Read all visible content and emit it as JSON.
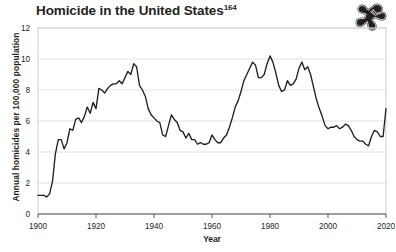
{
  "figure": {
    "title": "Homicide in the United States",
    "title_superscript": "164",
    "icon": "body-outline-icon",
    "background_color": "#ffffff",
    "line_color": "#231f20",
    "grid_color": "#d9d9d9"
  },
  "chart_data": {
    "type": "line",
    "title": "Homicide in the United States",
    "xlabel": "Year",
    "ylabel": "Annual homicides per 100,000 population",
    "xlim": [
      1900,
      2020
    ],
    "ylim": [
      0,
      12
    ],
    "xticks": [
      "1900",
      "1920",
      "1940",
      "1960",
      "1980",
      "2000",
      "2020"
    ],
    "xtick_values": [
      1900,
      1920,
      1940,
      1960,
      1980,
      2000,
      2020
    ],
    "yticks": [
      "0",
      "2",
      "4",
      "6",
      "8",
      "10",
      "12"
    ],
    "ytick_values": [
      0,
      2,
      4,
      6,
      8,
      10,
      12
    ],
    "grid": true,
    "legend": false,
    "series": [
      {
        "name": "Annual homicides per 100,000 population",
        "color": "#231f20",
        "x": [
          1900,
          1901,
          1902,
          1903,
          1904,
          1905,
          1906,
          1907,
          1908,
          1909,
          1910,
          1911,
          1912,
          1913,
          1914,
          1915,
          1916,
          1917,
          1918,
          1919,
          1920,
          1921,
          1922,
          1923,
          1924,
          1925,
          1926,
          1927,
          1928,
          1929,
          1930,
          1931,
          1932,
          1933,
          1934,
          1935,
          1936,
          1937,
          1938,
          1939,
          1940,
          1941,
          1942,
          1943,
          1944,
          1945,
          1946,
          1947,
          1948,
          1949,
          1950,
          1951,
          1952,
          1953,
          1954,
          1955,
          1956,
          1957,
          1958,
          1959,
          1960,
          1961,
          1962,
          1963,
          1964,
          1965,
          1966,
          1967,
          1968,
          1969,
          1970,
          1971,
          1972,
          1973,
          1974,
          1975,
          1976,
          1977,
          1978,
          1979,
          1980,
          1981,
          1982,
          1983,
          1984,
          1985,
          1986,
          1987,
          1988,
          1989,
          1990,
          1991,
          1992,
          1993,
          1994,
          1995,
          1996,
          1997,
          1998,
          1999,
          2000,
          2001,
          2002,
          2003,
          2004,
          2005,
          2006,
          2007,
          2008,
          2009,
          2010,
          2011,
          2012,
          2013,
          2014,
          2015,
          2016,
          2017,
          2018,
          2019,
          2020
        ],
        "values": [
          1.2,
          1.2,
          1.2,
          1.1,
          1.3,
          2.1,
          3.9,
          4.8,
          4.8,
          4.2,
          4.6,
          5.5,
          5.4,
          6.1,
          6.2,
          5.9,
          6.3,
          6.9,
          6.5,
          7.2,
          6.8,
          8.1,
          8.0,
          7.8,
          8.1,
          8.3,
          8.4,
          8.4,
          8.6,
          8.4,
          8.8,
          9.2,
          9.0,
          9.7,
          9.5,
          8.3,
          8.0,
          7.6,
          6.8,
          6.4,
          6.2,
          6.0,
          5.9,
          5.1,
          5.0,
          5.7,
          6.4,
          6.1,
          5.9,
          5.4,
          5.3,
          4.9,
          5.2,
          4.8,
          4.8,
          4.5,
          4.6,
          4.5,
          4.5,
          4.6,
          5.1,
          4.8,
          4.6,
          4.6,
          4.9,
          5.1,
          5.6,
          6.2,
          6.9,
          7.3,
          7.9,
          8.6,
          9.0,
          9.4,
          9.8,
          9.6,
          8.8,
          8.8,
          9.0,
          9.7,
          10.2,
          9.8,
          9.1,
          8.3,
          7.9,
          8.0,
          8.6,
          8.3,
          8.4,
          8.7,
          9.4,
          9.8,
          9.3,
          9.5,
          9.0,
          8.2,
          7.4,
          6.8,
          6.3,
          5.7,
          5.5,
          5.6,
          5.6,
          5.7,
          5.5,
          5.6,
          5.8,
          5.7,
          5.4,
          5.0,
          4.8,
          4.7,
          4.7,
          4.5,
          4.4,
          5.0,
          5.4,
          5.3,
          5.0,
          5.0,
          6.8
        ]
      }
    ]
  }
}
